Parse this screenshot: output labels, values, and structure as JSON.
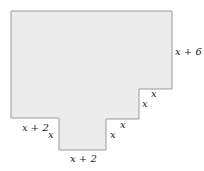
{
  "diagram": {
    "type": "composite-polygon",
    "fill_color": "#ececec",
    "stroke_color": "#9a9a9a",
    "vertices": [
      [
        11,
        11
      ],
      [
        172,
        11
      ],
      [
        172,
        89
      ],
      [
        139,
        89
      ],
      [
        139,
        119
      ],
      [
        106,
        119
      ],
      [
        106,
        150
      ],
      [
        59,
        150
      ],
      [
        59,
        118
      ],
      [
        11,
        118
      ]
    ],
    "labels": {
      "right_side": "x + 6",
      "right_step_top": "x",
      "right_step_side": "x",
      "middle_step_top": "x",
      "middle_step_side": "x",
      "left_bottom_edge": "x + 2",
      "left_notch_side": "x",
      "bottom_edge": "x + 2"
    }
  }
}
